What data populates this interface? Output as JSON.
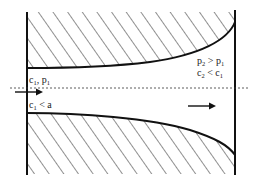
{
  "diagram": {
    "inlet_label": {
      "c": "c",
      "c_sub": "1",
      "sep": ", ",
      "p": "p",
      "p_sub": "1"
    },
    "inlet_condition": {
      "c": "c",
      "c_sub": "1",
      "op": " < ",
      "rhs": "a"
    },
    "outlet_pressure": {
      "p2": "p",
      "p2_sub": "2",
      "op": " > ",
      "p1": "p",
      "p1_sub": "1"
    },
    "outlet_velocity": {
      "c2": "c",
      "c2_sub": "2",
      "op": " < ",
      "c1": "c",
      "c1_sub": "1"
    },
    "colors": {
      "line": "#111111",
      "hatch": "#222222",
      "background": "#ffffff"
    }
  }
}
